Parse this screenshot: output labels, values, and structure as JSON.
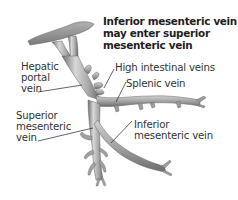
{
  "diagram": {
    "note": "Inferior mesenteric vein\nmay enter superior\nmesenteric vein",
    "labels": {
      "hepatic_portal_vein": "Hepatic\nportal\nvein",
      "high_intestinal_veins": "High intestinal veins",
      "splenic_vein": "Splenic vein",
      "superior_mesenteric_vein": "Superior\nmesenteric\nvein",
      "inferior_mesenteric_vein": "Inferior\nmesenteric vein"
    },
    "colors": {
      "background": "#ffffff",
      "vein_fill": "#a8a8a8",
      "vein_highlight": "#d8d8d8",
      "vein_shadow": "#6e6e6e",
      "liver_fill": "#8c8c8c",
      "leader_line": "#222222",
      "text": "#333333"
    }
  }
}
